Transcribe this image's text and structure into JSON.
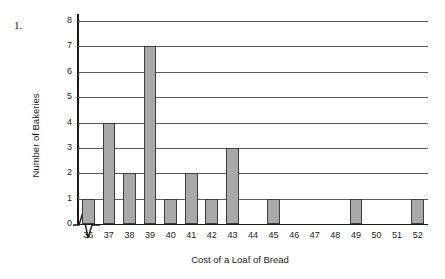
{
  "problem_number": "1.",
  "chart_data": {
    "type": "bar",
    "title": "",
    "xlabel": "Cost of a Loaf of Bread",
    "ylabel": "Number of Bakeries",
    "categories": [
      "36",
      "37",
      "38",
      "39",
      "40",
      "41",
      "42",
      "43",
      "44",
      "45",
      "46",
      "47",
      "48",
      "49",
      "50",
      "51",
      "52"
    ],
    "values": [
      1,
      4,
      2,
      7,
      1,
      2,
      1,
      3,
      0,
      1,
      0,
      0,
      0,
      1,
      0,
      0,
      1
    ],
    "yticks": [
      "0",
      "1",
      "2",
      "3",
      "4",
      "5",
      "6",
      "7",
      "8"
    ],
    "ylim": [
      0,
      8
    ],
    "grid": true,
    "legend": null,
    "axis_break": "x-axis break between origin and first category",
    "bar_color": "#a9a9a9",
    "bar_border_color": "#3d3d3d",
    "grid_color": "#595959",
    "axis_color": "#1a1a1a"
  }
}
